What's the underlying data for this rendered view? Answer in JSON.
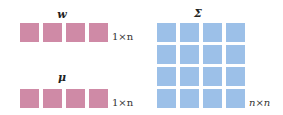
{
  "diagram": {
    "vectors": [
      {
        "symbol": "w",
        "dims": "1×n",
        "cells": 4,
        "color": "#cf8aa6"
      },
      {
        "symbol": "μ",
        "dims": "1×n",
        "cells": 4,
        "color": "#cf8aa6"
      }
    ],
    "matrix": {
      "symbol": "Σ",
      "dims": "n×n",
      "rows": 4,
      "cols": 4,
      "color": "#9cc0e8"
    }
  }
}
